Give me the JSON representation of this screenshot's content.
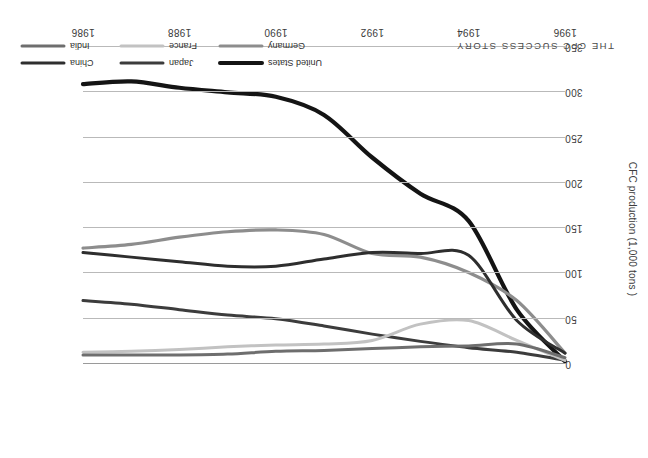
{
  "chart_data": {
    "type": "line",
    "title": "THE CFC SUCCESS STORY",
    "xlabel": "",
    "ylabel": "CFC production (1,000 tons )",
    "x": [
      1986,
      1987,
      1988,
      1989,
      1990,
      1991,
      1992,
      1993,
      1994,
      1995,
      1996
    ],
    "xticks": [
      1986,
      1988,
      1990,
      1992,
      1994,
      1996
    ],
    "yticks": [
      0,
      50,
      100,
      150,
      200,
      250,
      300,
      350
    ],
    "ylim": [
      0,
      350
    ],
    "xlim_display": "1986 at right, 1996 at left (axis reversed)",
    "grid": "horizontal",
    "legend_position": "bottom",
    "series": [
      {
        "name": "United States",
        "color": "#141414",
        "width": 4.2,
        "values": [
          309,
          312,
          305,
          300,
          295,
          275,
          228,
          188,
          158,
          60,
          3
        ]
      },
      {
        "name": "Germany",
        "color": "#8d8d8d",
        "width": 3.2,
        "values": [
          128,
          132,
          140,
          146,
          148,
          143,
          122,
          118,
          101,
          70,
          12
        ]
      },
      {
        "name": "China",
        "color": "#2e2e2e",
        "width": 3.0,
        "values": [
          123,
          118,
          113,
          108,
          108,
          116,
          123,
          122,
          120,
          48,
          12
        ]
      },
      {
        "name": "Japan",
        "color": "#3c3c3c",
        "width": 3.0,
        "values": [
          70,
          66,
          60,
          54,
          50,
          42,
          33,
          25,
          18,
          13,
          4
        ]
      },
      {
        "name": "France",
        "color": "#c2c2c2",
        "width": 3.0,
        "values": [
          13,
          14,
          16,
          19,
          21,
          22,
          26,
          44,
          48,
          26,
          4
        ]
      },
      {
        "name": "India",
        "color": "#6e6e6e",
        "width": 3.0,
        "values": [
          10,
          10,
          10,
          11,
          14,
          15,
          17,
          19,
          20,
          22,
          7
        ]
      }
    ]
  },
  "axis": {
    "y_labels": [
      "0",
      "50",
      "100",
      "150",
      "200",
      "250",
      "300",
      "350"
    ],
    "x_labels": [
      "1986",
      "1988",
      "1990",
      "1992",
      "1994",
      "1996"
    ],
    "y_title": "CFC production (1,000 tons )"
  },
  "title": {
    "text": "THE CFC SUCCESS STORY"
  },
  "legend": {
    "items": [
      {
        "label": "United States",
        "color": "#141414"
      },
      {
        "label": "Germany",
        "color": "#8d8d8d"
      },
      {
        "label": "Japan",
        "color": "#3c3c3c"
      },
      {
        "label": "France",
        "color": "#c2c2c2"
      },
      {
        "label": "China",
        "color": "#2e2e2e"
      },
      {
        "label": "India",
        "color": "#6e6e6e"
      }
    ]
  }
}
